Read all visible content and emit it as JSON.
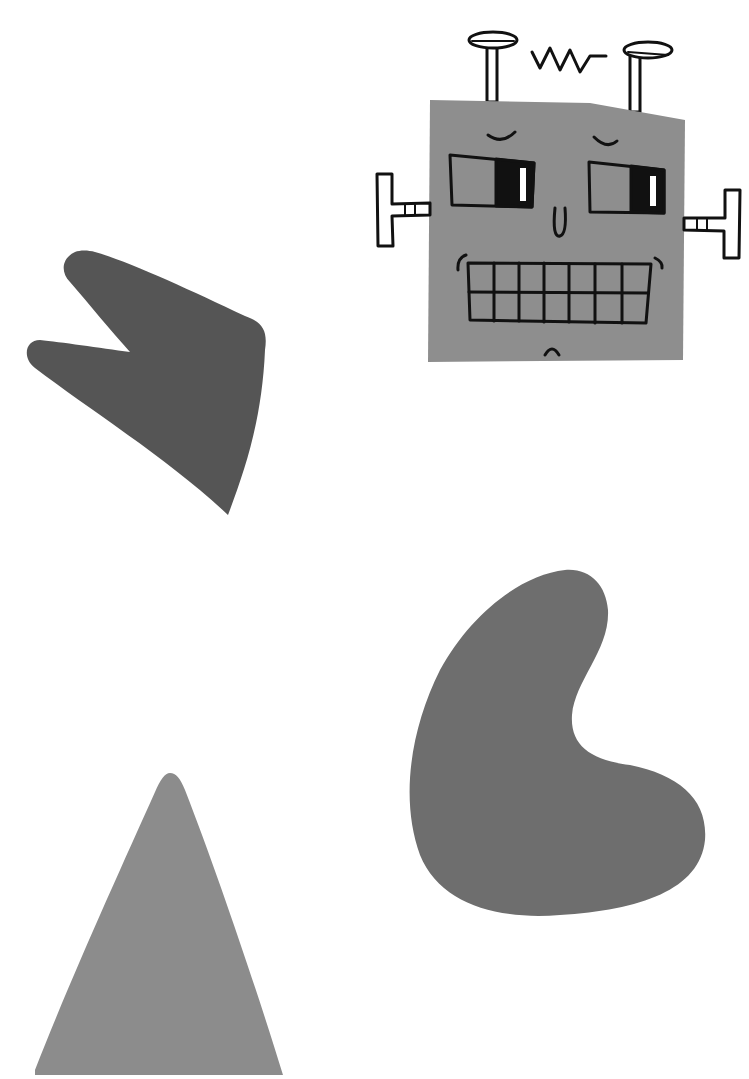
{
  "scene": {
    "description": "Illustration of a cartoon robot head and three abstract gray shapes",
    "background": "#ffffff",
    "shapes": [
      {
        "name": "notched-arrow-shape",
        "color": "#555555"
      },
      {
        "name": "bean-shape",
        "color": "#6e6e6e"
      },
      {
        "name": "triangle-shape",
        "color": "#8c8c8c"
      }
    ],
    "robot": {
      "face_color": "#8e8e8e",
      "line_color": "#111111",
      "features": [
        "antennae",
        "zigzag",
        "eyebrows",
        "eyes",
        "nose",
        "teeth-grin",
        "chin",
        "bolt-ears"
      ]
    }
  }
}
